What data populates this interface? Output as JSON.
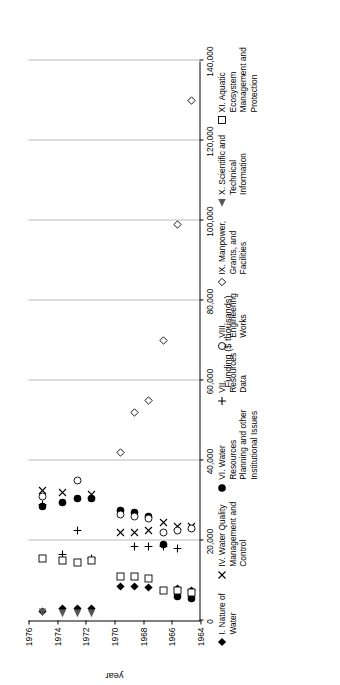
{
  "chart_data": {
    "type": "scatter",
    "title": "",
    "xlabel": "Funding ($ thousands)",
    "ylabel": "year",
    "orientation": "rotated-90",
    "grid": true,
    "legend_position": "top",
    "x_axis": {
      "label": "year",
      "ticks": [
        "1964",
        "1966",
        "1968",
        "1970",
        "1972",
        "1974",
        "1976"
      ],
      "min": 1964,
      "max": 1976
    },
    "y_axis": {
      "label": "Funding ($ thousands)",
      "ticks": [
        "0",
        "20,000",
        "40,000",
        "60,000",
        "80,000",
        "100,000",
        "120,000",
        "140,000"
      ],
      "tick_values": [
        0,
        20000,
        40000,
        60000,
        80000,
        100000,
        120000,
        140000
      ],
      "min": 0,
      "max": 140000
    },
    "series": [
      {
        "name": "I. Nature of Water",
        "marker": "filled-diamond",
        "points": [
          {
            "x": 1964.6,
            "y": 7500
          },
          {
            "x": 1965.6,
            "y": 8000
          },
          {
            "x": 1967.6,
            "y": 8200
          },
          {
            "x": 1968.6,
            "y": 8400
          },
          {
            "x": 1969.6,
            "y": 8600
          },
          {
            "x": 1971.6,
            "y": 3000
          },
          {
            "x": 1972.6,
            "y": 3000
          },
          {
            "x": 1973.6,
            "y": 3000
          },
          {
            "x": 1975.0,
            "y": 2200
          }
        ]
      },
      {
        "name": "IV. Water Quality Management and Control",
        "marker": "cross-x",
        "points": [
          {
            "x": 1964.6,
            "y": 23500
          },
          {
            "x": 1965.6,
            "y": 23500
          },
          {
            "x": 1966.6,
            "y": 24500
          },
          {
            "x": 1967.6,
            "y": 22500
          },
          {
            "x": 1968.6,
            "y": 22000
          },
          {
            "x": 1969.6,
            "y": 22000
          },
          {
            "x": 1971.6,
            "y": 31500
          },
          {
            "x": 1973.6,
            "y": 32000
          },
          {
            "x": 1975.0,
            "y": 32500
          }
        ]
      },
      {
        "name": "VI. Water Resources Planning and other Institutional Issues",
        "marker": "filled-circle",
        "points": [
          {
            "x": 1964.6,
            "y": 5500
          },
          {
            "x": 1965.6,
            "y": 6000
          },
          {
            "x": 1966.6,
            "y": 19000
          },
          {
            "x": 1967.6,
            "y": 26000
          },
          {
            "x": 1968.6,
            "y": 27000
          },
          {
            "x": 1969.6,
            "y": 27500
          },
          {
            "x": 1971.6,
            "y": 30500
          },
          {
            "x": 1972.6,
            "y": 30500
          },
          {
            "x": 1973.6,
            "y": 29500
          },
          {
            "x": 1975.0,
            "y": 28500
          }
        ]
      },
      {
        "name": "VII. Resources Data",
        "marker": "plus",
        "points": [
          {
            "x": 1965.6,
            "y": 18000
          },
          {
            "x": 1966.6,
            "y": 18500
          },
          {
            "x": 1967.6,
            "y": 18500
          },
          {
            "x": 1968.6,
            "y": 18500
          },
          {
            "x": 1971.6,
            "y": 15500
          },
          {
            "x": 1972.6,
            "y": 22500
          },
          {
            "x": 1973.6,
            "y": 16500
          },
          {
            "x": 1975.0,
            "y": 29000
          }
        ]
      },
      {
        "name": "VIII. Engineering Works",
        "marker": "open-circle",
        "points": [
          {
            "x": 1964.6,
            "y": 23000
          },
          {
            "x": 1965.6,
            "y": 22500
          },
          {
            "x": 1966.6,
            "y": 22000
          },
          {
            "x": 1967.6,
            "y": 25500
          },
          {
            "x": 1968.6,
            "y": 26000
          },
          {
            "x": 1969.6,
            "y": 26500
          },
          {
            "x": 1972.6,
            "y": 35000
          },
          {
            "x": 1975.0,
            "y": 31000
          }
        ]
      },
      {
        "name": "IX. Manpower, Grants, and Facilities",
        "marker": "open-diamond",
        "points": [
          {
            "x": 1964.6,
            "y": 130000
          },
          {
            "x": 1965.6,
            "y": 99000
          },
          {
            "x": 1966.6,
            "y": 70000
          },
          {
            "x": 1967.6,
            "y": 55000
          },
          {
            "x": 1968.6,
            "y": 52000
          },
          {
            "x": 1969.6,
            "y": 42000
          }
        ]
      },
      {
        "name": "X. Scientific and Technical Information",
        "marker": "filled-triangle",
        "points": [
          {
            "x": 1971.6,
            "y": 1800
          },
          {
            "x": 1972.6,
            "y": 1800
          },
          {
            "x": 1973.6,
            "y": 1800
          },
          {
            "x": 1975.0,
            "y": 2000
          }
        ]
      },
      {
        "name": "XI. Aquatic Ecosystem Management and Protection",
        "marker": "open-square",
        "points": [
          {
            "x": 1964.6,
            "y": 7000
          },
          {
            "x": 1965.6,
            "y": 7500
          },
          {
            "x": 1966.6,
            "y": 7500
          },
          {
            "x": 1967.6,
            "y": 10500
          },
          {
            "x": 1968.6,
            "y": 11000
          },
          {
            "x": 1969.6,
            "y": 11000
          },
          {
            "x": 1971.6,
            "y": 15000
          },
          {
            "x": 1972.6,
            "y": 14500
          },
          {
            "x": 1973.6,
            "y": 15000
          },
          {
            "x": 1975.0,
            "y": 15500
          }
        ]
      }
    ]
  },
  "legend": {
    "items": [
      {
        "marker": "filled-diamond",
        "glyph": "◆",
        "label": "I. Nature of Water"
      },
      {
        "marker": "cross-x",
        "glyph": "✕",
        "label": "IV. Water Quality Management and Control"
      },
      {
        "marker": "filled-circle",
        "glyph": "●",
        "label": "VI. Water Resources Planning and other Institutional Issues"
      },
      {
        "marker": "plus",
        "glyph": "＋",
        "label": "VII. Resources Data"
      },
      {
        "marker": "open-circle",
        "glyph": "○",
        "label": "VIII. Engineering Works"
      },
      {
        "marker": "open-diamond",
        "glyph": "◇",
        "label": "IX. Manpower, Grants, and Facilities"
      },
      {
        "marker": "filled-triangle",
        "glyph": "◀",
        "label": "X. Scientific and Technical Information"
      },
      {
        "marker": "open-square",
        "glyph": "□",
        "label": "XI. Aquatic Ecosystem Management and Protection"
      }
    ]
  },
  "axes": {
    "funding_title": "Funding ($ thousands)",
    "year_title": "year",
    "funding_ticks": [
      "0",
      "20,000",
      "40,000",
      "60,000",
      "80,000",
      "100,000",
      "120,000",
      "140,000"
    ],
    "year_ticks": [
      "1964",
      "1966",
      "1968",
      "1970",
      "1972",
      "1974",
      "1976"
    ]
  },
  "colors": {
    "axis": "#000000",
    "grid": "#b9b9b9",
    "marker": "#000000",
    "background": "#ffffff"
  }
}
